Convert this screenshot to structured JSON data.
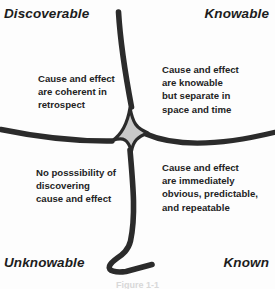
{
  "diagram": {
    "colors": {
      "stroke": "#2b2b2b",
      "center_fill": "#c9c9c9",
      "background": "#fdfdfd",
      "text": "#232323",
      "corner_text": "#1c1c1c"
    },
    "corners": {
      "top_left": "Discoverable",
      "top_right": "Knowable",
      "bottom_left": "Unknowable",
      "bottom_right": "Known"
    },
    "quadrants": {
      "top_left": "Cause and effect\nare coherent in\nretrospect",
      "top_right": "Cause and effect\nare knowable\nbut separate in\nspace and time",
      "bottom_left": "No posssibility of\ndiscovering\ncause and effect",
      "bottom_right": "Cause and effect\nare immediately\nobvious, predictable,\nand repeatable"
    },
    "caption": "Figure 1-1"
  }
}
